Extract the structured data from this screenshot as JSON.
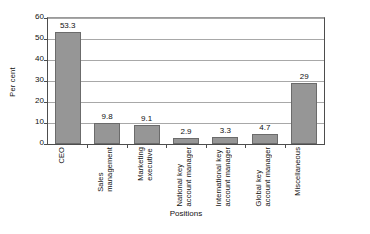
{
  "chart_data": {
    "type": "bar",
    "title": "",
    "xlabel": "Positions",
    "ylabel": "Per cent",
    "categories": [
      "CEO",
      "Sales management",
      "Marketing executive",
      "National key account manager",
      "International key account manager",
      "Global key account manager",
      "Miscellaneous"
    ],
    "values": [
      53.3,
      9.8,
      9.1,
      2.9,
      3.3,
      4.7,
      29
    ],
    "value_labels": [
      "53.3",
      "9.8",
      "9.1",
      "2.9",
      "3.3",
      "4.7",
      "29"
    ],
    "ylim": [
      0,
      60
    ],
    "ytick_labels": [
      "60",
      "50",
      "40",
      "30",
      "20",
      "10",
      "0"
    ],
    "ytick_values": [
      60,
      50,
      40,
      30,
      20,
      10,
      0
    ],
    "grid": "horizontal",
    "legend": "none",
    "bar_color": "#969696",
    "bar_edge_color": "#6b6b6b",
    "axis_color": "#4d4d4d",
    "gridline_color": "#a8a8a8",
    "background": "#ffffff"
  }
}
